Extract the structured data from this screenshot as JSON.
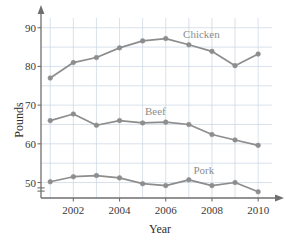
{
  "chart_data": {
    "type": "line",
    "title": "",
    "subtitle": "",
    "xlabel": "Year",
    "ylabel": "Pounds",
    "x": [
      2001,
      2002,
      2003,
      2004,
      2005,
      2006,
      2007,
      2008,
      2009,
      2010
    ],
    "xlim": [
      2000.6,
      2010.6
    ],
    "ylim": [
      46.0,
      92.0
    ],
    "x_tick_labels": [
      "2002",
      "2004",
      "2006",
      "2008",
      "2010"
    ],
    "x_ticks": [
      2002,
      2004,
      2006,
      2008,
      2010
    ],
    "y_tick_labels": [
      "50",
      "60",
      "70",
      "80",
      "90"
    ],
    "y_ticks": [
      50,
      60,
      70,
      80,
      90
    ],
    "y_minor_ticks": [
      55,
      65,
      75,
      85
    ],
    "grid": true,
    "grid_color": "#c9d4e4",
    "axis_break": true,
    "axis_break_position": 48.2,
    "legend_position": "inline-labels",
    "series": [
      {
        "name": "Chicken",
        "color": "#8d8d8d",
        "label_x": 2006.75,
        "label_y": 88.2,
        "values": [
          77.0,
          81.0,
          82.3,
          84.8,
          86.6,
          87.2,
          85.6,
          83.9,
          80.2,
          83.2
        ]
      },
      {
        "name": "Beef",
        "color": "#8d8d8d",
        "label_x": 2005.1,
        "label_y": 68.1,
        "values": [
          66.0,
          67.7,
          64.8,
          66.0,
          65.4,
          65.6,
          65.0,
          62.4,
          61.0,
          59.6
        ]
      },
      {
        "name": "Pork",
        "color": "#8d8d8d",
        "label_x": 2007.2,
        "label_y": 53.1,
        "values": [
          50.2,
          51.5,
          51.8,
          51.2,
          49.7,
          49.2,
          50.7,
          49.2,
          50.0,
          47.6
        ]
      }
    ]
  },
  "axes": {
    "y_title": "Pounds",
    "x_title": "Year"
  }
}
